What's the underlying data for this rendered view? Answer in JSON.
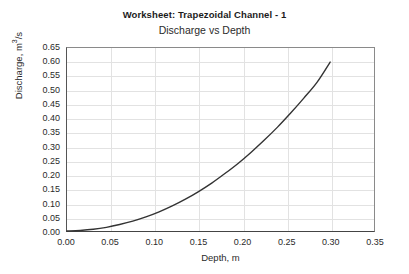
{
  "chart_data": {
    "type": "line",
    "title": "Worksheet: Trapezoidal Channel - 1",
    "subtitle": "Discharge vs Depth",
    "xlabel": "Depth, m",
    "ylabel_prefix": "Discharge, m",
    "ylabel_sup": "3",
    "ylabel_suffix": "/s",
    "xlim": [
      0.0,
      0.35
    ],
    "ylim": [
      0.0,
      0.65
    ],
    "grid": true,
    "legend": "none",
    "line_color": "#333333",
    "grid_color": "#e2e2e2",
    "xticks": [
      "0.00",
      "0.05",
      "0.10",
      "0.15",
      "0.20",
      "0.25",
      "0.30",
      "0.35"
    ],
    "yticks": [
      "0.00",
      "0.05",
      "0.10",
      "0.15",
      "0.20",
      "0.25",
      "0.30",
      "0.35",
      "0.40",
      "0.45",
      "0.50",
      "0.55",
      "0.60",
      "0.65"
    ],
    "series": [
      {
        "name": "Discharge vs Depth",
        "x": [
          0.0,
          0.015,
          0.03,
          0.045,
          0.06,
          0.075,
          0.09,
          0.105,
          0.12,
          0.135,
          0.15,
          0.165,
          0.18,
          0.195,
          0.21,
          0.225,
          0.24,
          0.255,
          0.27,
          0.285,
          0.3
        ],
        "y": [
          0.0,
          0.002,
          0.006,
          0.013,
          0.023,
          0.035,
          0.05,
          0.068,
          0.089,
          0.113,
          0.14,
          0.17,
          0.204,
          0.24,
          0.28,
          0.323,
          0.369,
          0.419,
          0.472,
          0.528,
          0.6
        ]
      }
    ]
  }
}
